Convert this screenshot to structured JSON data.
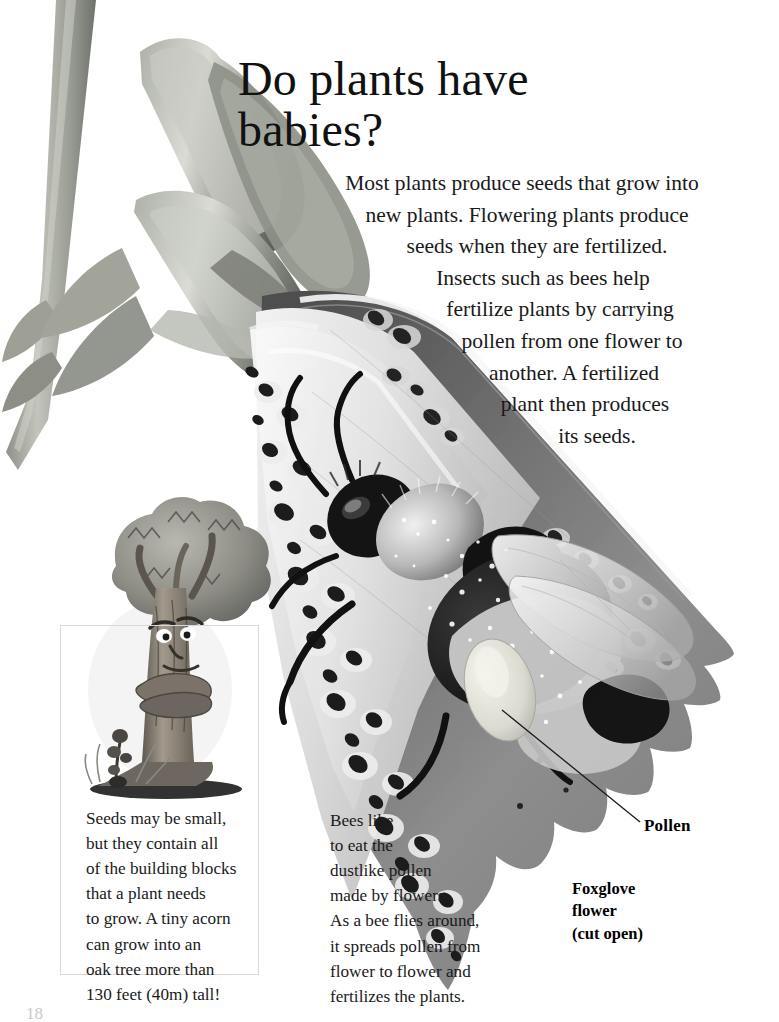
{
  "page": {
    "title_line1": "Do plants have",
    "title_line2": "babies?",
    "folio": "18"
  },
  "lead": {
    "full_text": "Most plants produce seeds that grow into new plants. Flowering plants produce seeds when they are fertilized. Insects such as bees help fertilize plants by carrying pollen from one flower to another. A fertilized plant then produces its seeds.",
    "lines": [
      "Most plants produce seeds that grow into",
      "new plants. Flowering plants produce",
      "seeds when they are fertilized.",
      "Insects such as bees help",
      "fertilize plants by carrying",
      "pollen from one flower to",
      "another. A fertilized",
      "plant then produces",
      "its seeds."
    ]
  },
  "caption_acorn": {
    "full_text": "Seeds may be small, but they contain all of the building blocks that a plant needs to grow. A tiny acorn can grow into an oak tree more than 130 feet (40m) tall!",
    "lines": [
      "Seeds may be small,",
      "but they contain all",
      "of the building blocks",
      "that a plant needs",
      "to grow. A tiny acorn",
      "can grow into an",
      "oak tree more than",
      "130 feet (40m) tall!"
    ]
  },
  "caption_bees": {
    "full_text": "Bees like to eat the dustlike pollen made by flowers. As a bee flies around, it spreads pollen from flower to flower and fertilizes the plants.",
    "lines": [
      "Bees like",
      "to eat the",
      "dustlike pollen",
      "made by flowers.",
      "As a bee flies around,",
      "it spreads pollen from",
      "flower to flower and",
      "fertilizes the plants."
    ]
  },
  "labels": {
    "pollen": "Pollen",
    "foxglove_line1": "Foxglove",
    "foxglove_line2": "flower",
    "foxglove_line3": "(cut open)"
  },
  "illustrations": {
    "foxglove_flower": "foxglove-flower-cut-open-illustration",
    "bumblebee": "bumblebee-illustration",
    "pollen_sac": "pollen-sac",
    "oak_tree_cartoon": "cartoon-oak-tree-with-acorn-sprout",
    "leader_line": "pollen-leader-line"
  },
  "colors": {
    "page_background": "#ffffff",
    "text": "#1a1a1a",
    "flower_petal_light": "#b9b9b9",
    "flower_petal_mid": "#8a8a8a",
    "flower_petal_dark": "#5a5a5a",
    "flower_spot": "#262626",
    "flower_spot_halo": "#e9e9e9",
    "stem_green_gray": "#a6a89e",
    "bee_body": "#1b1b1b",
    "bee_fuzz_light": "#d6d6d6",
    "pollen_sac": "#dcdcd4",
    "box_border": "#d8d8d8"
  }
}
